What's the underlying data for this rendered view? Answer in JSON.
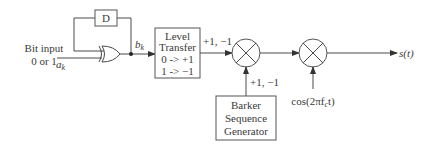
{
  "diagram": {
    "input": {
      "line1": "Bit input",
      "line2": "0 or 1",
      "symbol": "a",
      "subscript": "k"
    },
    "delay_block": {
      "label": "D"
    },
    "xor_output": {
      "symbol": "b",
      "subscript": "k"
    },
    "level_transfer": {
      "lines": [
        "Level",
        "Transfer",
        "0  ->  +1",
        "1  ->  −1"
      ]
    },
    "level_output_label": "+1, −1",
    "barker": {
      "lines": [
        "Barker",
        "Sequence",
        "Generator"
      ],
      "output_label": "+1, −1"
    },
    "carrier": {
      "label": "cos(2πf",
      "subscript": "c",
      "suffix": "t)"
    },
    "output": {
      "label": "s(t)"
    },
    "icons": {
      "xor": "xor-gate-icon",
      "multiplier": "multiplier-icon"
    }
  }
}
